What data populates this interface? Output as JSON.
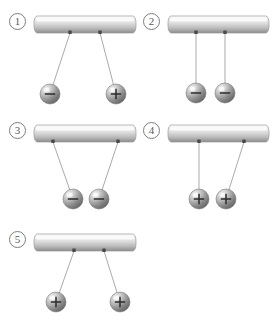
{
  "figure": {
    "background_color": "#ffffff",
    "width": 277,
    "height": 326
  },
  "style": {
    "bar_top_color": "#fdfdfd",
    "bar_mid_color": "#d8d8d8",
    "bar_bottom_color": "#8f8f8f",
    "bar_outline_color": "#9a9a9a",
    "string_color": "#9b9b9b",
    "anchor_color": "#4a4a4a",
    "sphere_light_color": "#f2f2f2",
    "sphere_mid_color": "#b4b4b4",
    "sphere_dark_color": "#6a6a6a",
    "sphere_outline_color": "#7a7a7a",
    "sign_color": "#2b2b2b",
    "label_text_color": "#5a5a5a",
    "label_ring_color": "#7d7d7d"
  },
  "panels": [
    {
      "id": "panel-1",
      "number_label": "①",
      "number_name": "one",
      "bar": {
        "x": 34,
        "y": 16,
        "width": 102,
        "height": 17
      },
      "anchors": [
        {
          "name": "anchor-left",
          "x": 70,
          "y": 33
        },
        {
          "name": "anchor-right",
          "x": 100,
          "y": 33
        }
      ],
      "spheres": [
        {
          "name": "sphere-left",
          "cx": 50,
          "cy": 94,
          "r": 10,
          "charge": "−",
          "charge_name": "negative",
          "anchor_index": 0
        },
        {
          "name": "sphere-right",
          "cx": 116,
          "cy": 94,
          "r": 10,
          "charge": "+",
          "charge_name": "positive",
          "anchor_index": 1
        }
      ],
      "configuration": "strings-diverge-outward"
    },
    {
      "id": "panel-2",
      "number_label": "②",
      "number_name": "two",
      "bar": {
        "x": 168,
        "y": 16,
        "width": 101,
        "height": 17
      },
      "anchors": [
        {
          "name": "anchor-left",
          "x": 196,
          "y": 33
        },
        {
          "name": "anchor-right",
          "x": 225,
          "y": 33
        }
      ],
      "spheres": [
        {
          "name": "sphere-left",
          "cx": 196,
          "cy": 93,
          "r": 10,
          "charge": "−",
          "charge_name": "negative",
          "anchor_index": 0
        },
        {
          "name": "sphere-right",
          "cx": 225,
          "cy": 93,
          "r": 10,
          "charge": "−",
          "charge_name": "negative",
          "anchor_index": 1
        }
      ],
      "configuration": "strings-vertical-parallel"
    },
    {
      "id": "panel-3",
      "number_label": "③",
      "number_name": "three",
      "bar": {
        "x": 34,
        "y": 125,
        "width": 102,
        "height": 17
      },
      "anchors": [
        {
          "name": "anchor-left",
          "x": 53,
          "y": 142
        },
        {
          "name": "anchor-right",
          "x": 118,
          "y": 142
        }
      ],
      "spheres": [
        {
          "name": "sphere-left",
          "cx": 73,
          "cy": 199,
          "r": 10,
          "charge": "−",
          "charge_name": "negative",
          "anchor_index": 0
        },
        {
          "name": "sphere-right",
          "cx": 99,
          "cy": 199,
          "r": 10,
          "charge": "−",
          "charge_name": "negative",
          "anchor_index": 1
        }
      ],
      "configuration": "strings-converge-inward"
    },
    {
      "id": "panel-4",
      "number_label": "④",
      "number_name": "four",
      "bar": {
        "x": 168,
        "y": 125,
        "width": 101,
        "height": 17
      },
      "anchors": [
        {
          "name": "anchor-left",
          "x": 199,
          "y": 142
        },
        {
          "name": "anchor-right",
          "x": 244,
          "y": 142
        }
      ],
      "spheres": [
        {
          "name": "sphere-left",
          "cx": 199,
          "cy": 199,
          "r": 10,
          "charge": "+",
          "charge_name": "positive",
          "anchor_index": 0
        },
        {
          "name": "sphere-right",
          "cx": 226,
          "cy": 199,
          "r": 10,
          "charge": "+",
          "charge_name": "positive",
          "anchor_index": 1
        }
      ],
      "configuration": "left-vertical-right-converges"
    },
    {
      "id": "panel-5",
      "number_label": "⑤",
      "number_name": "five",
      "bar": {
        "x": 34,
        "y": 234,
        "width": 102,
        "height": 17
      },
      "anchors": [
        {
          "name": "anchor-left",
          "x": 74,
          "y": 251
        },
        {
          "name": "anchor-right",
          "x": 104,
          "y": 251
        }
      ],
      "spheres": [
        {
          "name": "sphere-left",
          "cx": 56,
          "cy": 302,
          "r": 10,
          "charge": "+",
          "charge_name": "positive",
          "anchor_index": 0
        },
        {
          "name": "sphere-right",
          "cx": 120,
          "cy": 302,
          "r": 10,
          "charge": "+",
          "charge_name": "positive",
          "anchor_index": 1
        }
      ],
      "configuration": "strings-diverge-outward"
    }
  ],
  "label_positions": [
    {
      "panel": "panel-1",
      "x": 9,
      "y": 13
    },
    {
      "panel": "panel-2",
      "x": 143,
      "y": 13
    },
    {
      "panel": "panel-3",
      "x": 9,
      "y": 122
    },
    {
      "panel": "panel-4",
      "x": 143,
      "y": 122
    },
    {
      "panel": "panel-5",
      "x": 9,
      "y": 231
    }
  ]
}
